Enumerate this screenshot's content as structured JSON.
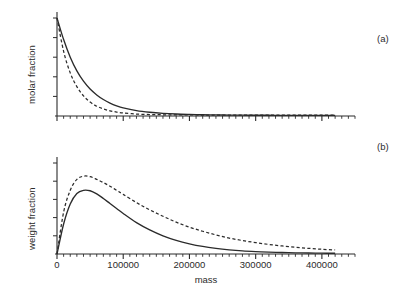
{
  "figure": {
    "width": 414,
    "height": 293,
    "background": "#ffffff",
    "ink_color": "#2b2b2b"
  },
  "panels": [
    {
      "tag": "(a)",
      "ylabel": "molar fraction"
    },
    {
      "tag": "(b)",
      "ylabel": "weight fraction"
    }
  ],
  "axis": {
    "xlabel": "mass",
    "xticklabels": [
      "0",
      "100000",
      "200000",
      "300000",
      "400000"
    ],
    "xtickvalues": [
      0,
      100000,
      200000,
      300000,
      400000
    ],
    "xlim": [
      0,
      450000
    ],
    "minor_ticks_per_interval": 10,
    "y_ticks_unlabeled": true
  },
  "chart_data": [
    {
      "type": "line",
      "title": "",
      "panel": "(a)",
      "xlabel": "mass",
      "ylabel": "molar fraction",
      "xlim": [
        0,
        450000
      ],
      "ylim": [
        0,
        1.05
      ],
      "grid": false,
      "legend": "none",
      "annotations": [
        "(a)"
      ],
      "x": [
        0,
        10000,
        20000,
        30000,
        40000,
        50000,
        60000,
        70000,
        80000,
        90000,
        100000,
        120000,
        140000,
        160000,
        180000,
        200000,
        220000,
        240000,
        260000,
        280000,
        300000,
        320000,
        340000,
        360000,
        380000,
        400000,
        420000
      ],
      "series": [
        {
          "name": "solid",
          "style": "solid",
          "values": [
            1.0,
            0.78,
            0.6,
            0.46,
            0.355,
            0.275,
            0.215,
            0.168,
            0.132,
            0.104,
            0.083,
            0.055,
            0.038,
            0.027,
            0.02,
            0.016,
            0.013,
            0.011,
            0.0095,
            0.0085,
            0.0078,
            0.0072,
            0.0068,
            0.0065,
            0.0062,
            0.006,
            0.0058
          ]
        },
        {
          "name": "dashed",
          "style": "dashed",
          "values": [
            1.0,
            0.66,
            0.44,
            0.3,
            0.205,
            0.142,
            0.1,
            0.072,
            0.053,
            0.04,
            0.031,
            0.02,
            0.015,
            0.0125,
            0.0112,
            0.0105,
            0.01,
            0.0097,
            0.0094,
            0.0092,
            0.009,
            0.0088,
            0.0087,
            0.0086,
            0.0085,
            0.0084,
            0.0083
          ]
        }
      ]
    },
    {
      "type": "line",
      "title": "",
      "panel": "(b)",
      "xlabel": "mass",
      "ylabel": "weight fraction",
      "xlim": [
        0,
        450000
      ],
      "ylim": [
        0,
        1.05
      ],
      "grid": false,
      "legend": "none",
      "annotations": [
        "(b)"
      ],
      "x": [
        0,
        10000,
        20000,
        30000,
        40000,
        50000,
        60000,
        70000,
        80000,
        90000,
        100000,
        120000,
        140000,
        160000,
        180000,
        200000,
        220000,
        240000,
        260000,
        280000,
        300000,
        320000,
        340000,
        360000,
        380000,
        400000,
        420000
      ],
      "series": [
        {
          "name": "solid",
          "style": "solid",
          "values": [
            0.0,
            0.33,
            0.55,
            0.665,
            0.7,
            0.695,
            0.66,
            0.61,
            0.555,
            0.5,
            0.445,
            0.345,
            0.265,
            0.2,
            0.15,
            0.112,
            0.083,
            0.062,
            0.046,
            0.034,
            0.026,
            0.02,
            0.016,
            0.013,
            0.011,
            0.009,
            0.008
          ]
        },
        {
          "name": "dashed",
          "style": "dashed",
          "values": [
            0.0,
            0.46,
            0.7,
            0.82,
            0.855,
            0.85,
            0.82,
            0.785,
            0.745,
            0.7,
            0.655,
            0.565,
            0.485,
            0.415,
            0.35,
            0.295,
            0.25,
            0.21,
            0.175,
            0.148,
            0.125,
            0.105,
            0.088,
            0.074,
            0.062,
            0.052,
            0.045
          ]
        }
      ]
    }
  ]
}
